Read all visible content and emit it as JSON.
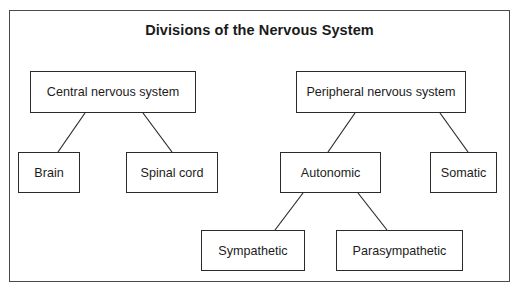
{
  "figure": {
    "title": "Divisions of the Nervous System",
    "frame_color": "#4a4a4a",
    "box_border_color": "#2b2b2b",
    "text_color": "#1c1c1c",
    "background": "#ffffff"
  },
  "nodes": [
    {
      "id": "cns",
      "label": "Central nervous system",
      "level": 1
    },
    {
      "id": "pns",
      "label": "Peripheral nervous system",
      "level": 1
    },
    {
      "id": "brain",
      "label": "Brain",
      "level": 2
    },
    {
      "id": "spinal_cord",
      "label": "Spinal cord",
      "level": 2
    },
    {
      "id": "autonomic",
      "label": "Autonomic",
      "level": 2
    },
    {
      "id": "somatic",
      "label": "Somatic",
      "level": 2
    },
    {
      "id": "sympathetic",
      "label": "Sympathetic",
      "level": 3
    },
    {
      "id": "parasympathetic",
      "label": "Parasympathetic",
      "level": 3
    }
  ],
  "edges": [
    {
      "from": "cns",
      "to": "brain"
    },
    {
      "from": "cns",
      "to": "spinal_cord"
    },
    {
      "from": "pns",
      "to": "autonomic"
    },
    {
      "from": "pns",
      "to": "somatic"
    },
    {
      "from": "autonomic",
      "to": "sympathetic"
    },
    {
      "from": "autonomic",
      "to": "parasympathetic"
    }
  ]
}
